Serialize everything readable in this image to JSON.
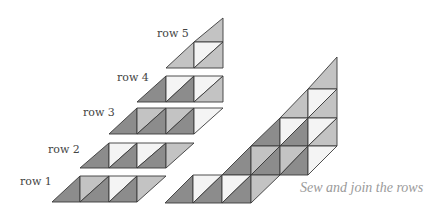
{
  "colors": {
    "dark": "#8c8c8c",
    "light": "#c3c3c3",
    "white": "#f4f4f4",
    "stroke": "#3a3a3a"
  },
  "labels": [
    {
      "text": "row 5",
      "x": 157,
      "y": 27
    },
    {
      "text": "row 4",
      "x": 117,
      "y": 71
    },
    {
      "text": "row 3",
      "x": 83,
      "y": 106
    },
    {
      "text": "row 2",
      "x": 48,
      "y": 143
    },
    {
      "text": "row 1",
      "x": 20,
      "y": 175
    }
  ],
  "caption": "Sew and join the rows",
  "rows": [
    {
      "name": "row 5",
      "pieces": [
        {
          "pts": "194,42 223,18 223,42",
          "fill": "light"
        },
        {
          "pts": "166,68 194,42 194,68",
          "fill": "light"
        },
        {
          "pts": "194,42 223,42 194,68",
          "fill": "white"
        },
        {
          "pts": "223,42 223,68 194,68",
          "fill": "light"
        }
      ]
    },
    {
      "name": "row 4",
      "pieces": [
        {
          "pts": "137,102 166,76 166,102",
          "fill": "dark"
        },
        {
          "pts": "166,76 194,76 166,102",
          "fill": "white"
        },
        {
          "pts": "194,76 194,102 166,102",
          "fill": "dark"
        },
        {
          "pts": "194,76 223,76 194,102",
          "fill": "white"
        },
        {
          "pts": "223,76 223,102 194,102",
          "fill": "light"
        }
      ]
    },
    {
      "name": "row 3",
      "pieces": [
        {
          "pts": "109,134 137,108 137,134",
          "fill": "dark"
        },
        {
          "pts": "137,108 166,108 137,134",
          "fill": "light"
        },
        {
          "pts": "166,108 166,134 137,134",
          "fill": "dark"
        },
        {
          "pts": "166,108 194,108 166,134",
          "fill": "light"
        },
        {
          "pts": "194,108 194,134 166,134",
          "fill": "dark"
        },
        {
          "pts": "194,108 223,108 194,134",
          "fill": "white"
        }
      ]
    },
    {
      "name": "row 2",
      "pieces": [
        {
          "pts": "80,168 109,143 109,168",
          "fill": "dark"
        },
        {
          "pts": "109,143 137,143 109,168",
          "fill": "white"
        },
        {
          "pts": "137,143 137,168 109,168",
          "fill": "dark"
        },
        {
          "pts": "137,143 166,143 137,168",
          "fill": "white"
        },
        {
          "pts": "166,143 166,168 137,168",
          "fill": "dark"
        },
        {
          "pts": "166,143 194,143 166,168",
          "fill": "light"
        }
      ]
    },
    {
      "name": "row 1",
      "pieces": [
        {
          "pts": "52,202 80,176 80,202",
          "fill": "dark"
        },
        {
          "pts": "80,176 109,176 80,202",
          "fill": "light"
        },
        {
          "pts": "109,176 109,202 80,202",
          "fill": "dark"
        },
        {
          "pts": "109,176 137,176 109,202",
          "fill": "white"
        },
        {
          "pts": "137,176 137,202 109,202",
          "fill": "dark"
        },
        {
          "pts": "137,176 166,176 137,202",
          "fill": "light"
        }
      ]
    }
  ],
  "assembled": {
    "pieces": [
      {
        "pts": "308,89 337,57 337,89",
        "fill": "light"
      },
      {
        "pts": "280,118 308,89 308,118",
        "fill": "light"
      },
      {
        "pts": "308,89 337,89 308,118",
        "fill": "white"
      },
      {
        "pts": "337,89 337,118 308,118",
        "fill": "light"
      },
      {
        "pts": "251,146 280,118 280,146",
        "fill": "dark"
      },
      {
        "pts": "280,118 308,118 280,146",
        "fill": "white"
      },
      {
        "pts": "308,118 308,146 280,146",
        "fill": "dark"
      },
      {
        "pts": "308,118 337,118 308,146",
        "fill": "white"
      },
      {
        "pts": "337,118 337,146 308,146",
        "fill": "light"
      },
      {
        "pts": "222,175 251,146 251,175",
        "fill": "dark"
      },
      {
        "pts": "251,146 280,146 251,175",
        "fill": "light"
      },
      {
        "pts": "280,146 280,175 251,175",
        "fill": "dark"
      },
      {
        "pts": "280,146 308,146 280,175",
        "fill": "light"
      },
      {
        "pts": "308,146 308,175 280,175",
        "fill": "dark"
      },
      {
        "pts": "308,146 337,146 308,175",
        "fill": "white"
      },
      {
        "pts": "193,175 222,175 193,203 165,203",
        "fill": "none"
      },
      {
        "pts": "165,203 193,175 193,203",
        "fill": "dark"
      },
      {
        "pts": "193,175 222,175 193,203",
        "fill": "white"
      },
      {
        "pts": "222,175 222,203 193,203",
        "fill": "dark"
      },
      {
        "pts": "222,175 251,175 222,203",
        "fill": "white"
      },
      {
        "pts": "251,175 251,203 222,203",
        "fill": "dark"
      },
      {
        "pts": "251,175 280,175 251,203",
        "fill": "light"
      }
    ],
    "extra_rows": [
      {
        "pts": "193,203 222,175 222,203",
        "fill": "none"
      }
    ]
  }
}
